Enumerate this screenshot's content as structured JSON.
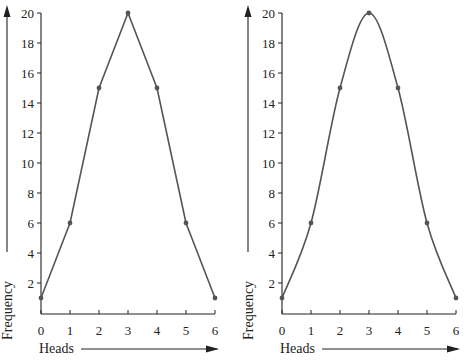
{
  "chart_data": [
    {
      "type": "line",
      "title": "",
      "xlabel": "Heads",
      "ylabel": "Frequency",
      "style": "straight segments (frequency polygon)",
      "x": [
        0,
        1,
        2,
        3,
        4,
        5,
        6
      ],
      "values": [
        1,
        6,
        15,
        20,
        15,
        6,
        1
      ],
      "xticks": [
        "0",
        "1",
        "2",
        "3",
        "4",
        "5",
        "6"
      ],
      "yticks": [
        "2",
        "4",
        "6",
        "8",
        "10",
        "12",
        "14",
        "16",
        "18",
        "20"
      ],
      "xlim": [
        0,
        6
      ],
      "ylim": [
        0,
        20
      ],
      "grid": false,
      "legend": null
    },
    {
      "type": "line",
      "title": "",
      "xlabel": "Heads",
      "ylabel": "Frequency",
      "style": "smooth curve",
      "x": [
        0,
        1,
        2,
        3,
        4,
        5,
        6
      ],
      "values": [
        1,
        6,
        15,
        20,
        15,
        6,
        1
      ],
      "xticks": [
        "0",
        "1",
        "2",
        "3",
        "4",
        "5",
        "6"
      ],
      "yticks": [
        "2",
        "4",
        "6",
        "8",
        "10",
        "12",
        "14",
        "16",
        "18",
        "20"
      ],
      "xlim": [
        0,
        6
      ],
      "ylim": [
        0,
        20
      ],
      "grid": false,
      "legend": null
    }
  ],
  "colors": {
    "line": "#555555",
    "axis": "#222222",
    "point": "#555555"
  }
}
